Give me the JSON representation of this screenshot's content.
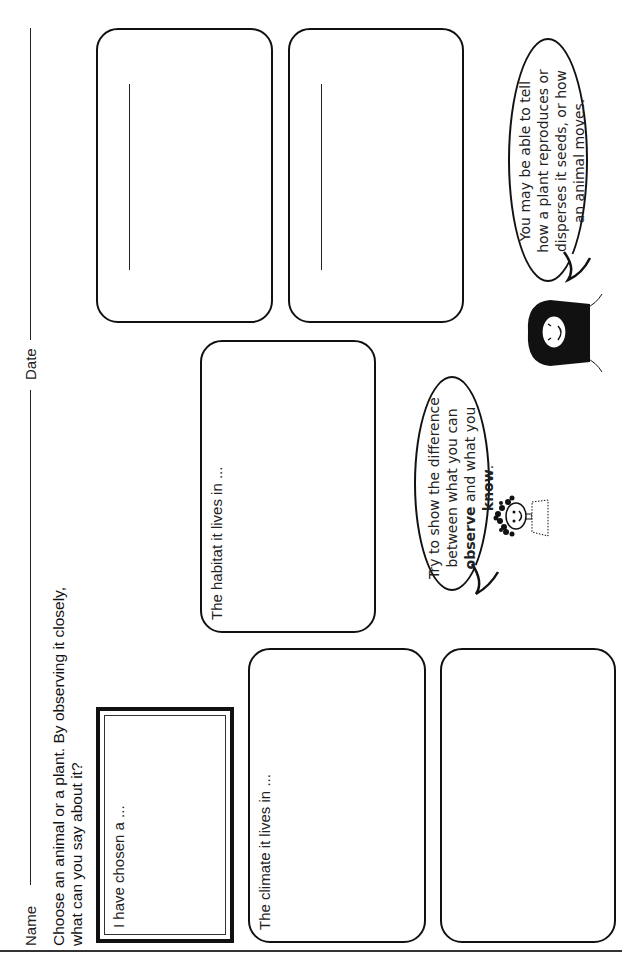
{
  "header": {
    "name_label": "Name",
    "date_label": "Date"
  },
  "instructions": {
    "line1": "Choose an animal or a plant. By observing it closely,",
    "line2": "what can you say about it?"
  },
  "boxes": {
    "chosen": {
      "label": "I have chosen a ..."
    },
    "climate": {
      "label": "The climate it lives in ..."
    },
    "habitat": {
      "label": "The habitat it lives in ..."
    },
    "bottom_blank": {
      "label": ""
    },
    "top_left": {
      "label": ""
    },
    "top_right": {
      "label": ""
    }
  },
  "speech_bubbles": {
    "boy": {
      "line1": "Try to show the difference",
      "line2": "between what you can",
      "line3_bold": "observe",
      "line3_rest": " and what you",
      "line4_bold": "know",
      "line4_rest": "."
    },
    "girl": {
      "line1": "You may be able to tell",
      "line2": "how a plant reproduces or",
      "line3": "disperses it seeds, or how",
      "line4": "an animal moves."
    }
  }
}
